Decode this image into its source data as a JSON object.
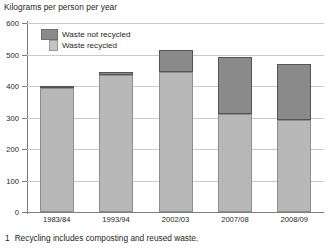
{
  "chart_data": {
    "type": "bar",
    "subtype": "stacked-vertical",
    "title": "Kilograms per person per year",
    "xlabel": "",
    "ylabel": "Kilograms per person per year",
    "categories": [
      "1983/84",
      "1993/94",
      "2002/03",
      "2007/08",
      "2008/09"
    ],
    "series": [
      {
        "name": "Waste not recycled",
        "color": "#8a8a8a",
        "values": [
          7,
          10,
          70,
          182,
          178
        ]
      },
      {
        "name": "Waste recycled",
        "color": "#b8b8b8",
        "values": [
          393,
          435,
          445,
          310,
          292
        ]
      }
    ],
    "totals": [
      400,
      445,
      515,
      492,
      470
    ],
    "ylim": [
      0,
      600
    ],
    "yticks": [
      0,
      100,
      200,
      300,
      400,
      500,
      600
    ],
    "ytick_labels": [
      "0",
      "100",
      "200",
      "300",
      "400",
      "500",
      "600"
    ],
    "grid": true,
    "legend_position": "top-left"
  },
  "footnote": {
    "number": "1",
    "text": "Recycling includes composting and reused waste."
  },
  "legend": {
    "items": [
      {
        "label": "Waste not recycled"
      },
      {
        "label": "Waste recycled"
      }
    ]
  }
}
